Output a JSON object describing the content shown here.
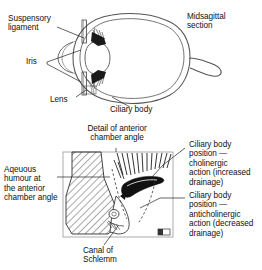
{
  "figure": {
    "type": "anatomical-diagram",
    "background_color": "#ffffff",
    "ink_color": "#111111",
    "width": 262,
    "height": 270
  },
  "upper_diagram": {
    "name": "midsagittal-eye-section",
    "caption": "Midsagittal\nsection",
    "labels": [
      {
        "id": "suspensory-ligament",
        "text": "Suspensory\nligament"
      },
      {
        "id": "iris",
        "text": "Iris"
      },
      {
        "id": "lens",
        "text": "Lens"
      },
      {
        "id": "ciliary-body",
        "text": "Ciliary body"
      },
      {
        "id": "midsagittal-section",
        "text": "Midsagittal\nsection"
      }
    ]
  },
  "lower_diagram": {
    "name": "anterior-chamber-angle-detail",
    "caption": "Detail of anterior\nchamber angle",
    "labels": [
      {
        "id": "detail-title",
        "text": "Detail of anterior\nchamber angle"
      },
      {
        "id": "aqueous-humour",
        "text": "Aqeuous\nhumour at\nthe anterior\nchamber angle"
      },
      {
        "id": "canal-of-schlemm",
        "text": "Canal of\nSchlemm"
      },
      {
        "id": "cholinergic",
        "text": "Ciliary body\nposition —\ncholinergic\naction (increased\ndrainage)"
      },
      {
        "id": "anticholinergic",
        "text": "Ciliary body\nposition —\nanticholinergic\naction (decreased\ndrainage)"
      }
    ]
  },
  "text": {
    "suspensory_ligament": "Suspensory\nligament",
    "iris": "Iris",
    "lens": "Lens",
    "ciliary_body": "Ciliary body",
    "midsagittal_section": "Midsagittal\nsection",
    "detail_title": "Detail of anterior\nchamber angle",
    "aqueous_humour": "Aqeuous\nhumour at\nthe anterior\nchamber angle",
    "canal_of_schlemm": "Canal of\nSchlemm",
    "cholinergic": "Ciliary body\nposition —\ncholinergic\naction (increased\ndrainage)",
    "anticholinergic": "Ciliary body\nposition —\nanticholinergic\naction (decreased\ndrainage)"
  }
}
